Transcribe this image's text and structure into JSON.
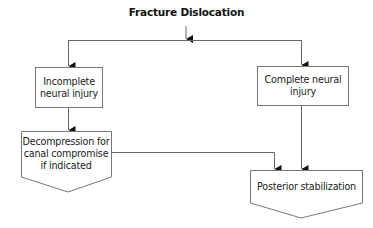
{
  "diagram": {
    "title": "Fracture Dislocation",
    "nodes": [
      {
        "id": "incomplete",
        "label": "Incomplete\nneural injury",
        "line1": "Incomplete",
        "line2": "neural injury",
        "shape": "rectangle"
      },
      {
        "id": "complete",
        "label": "Complete neural injury",
        "line1": "Complete neural",
        "line2": "injury",
        "shape": "rectangle"
      },
      {
        "id": "decompression",
        "label": "Decompression for canal compromise if indicated",
        "line1": "Decompression for",
        "line2": "canal compromise",
        "line3": "if indicated",
        "shape": "pentagon-down"
      },
      {
        "id": "posterior",
        "label": "Posterior stabilization",
        "line1": "Posterior stabilization",
        "shape": "pentagon-down"
      }
    ],
    "edges": [
      {
        "from": "title",
        "to": "incomplete"
      },
      {
        "from": "title",
        "to": "complete"
      },
      {
        "from": "incomplete",
        "to": "decompression"
      },
      {
        "from": "decompression",
        "to": "posterior"
      },
      {
        "from": "complete",
        "to": "posterior"
      }
    ],
    "colors": {
      "line": "#555555",
      "text": "#222222",
      "background": "#ffffff"
    }
  }
}
